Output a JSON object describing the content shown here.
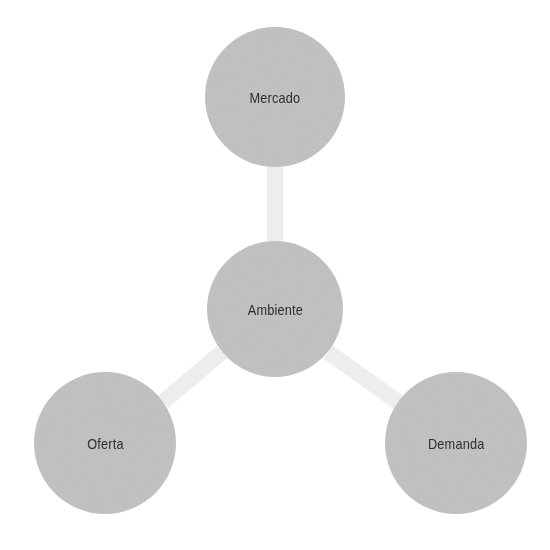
{
  "diagram": {
    "type": "hub-and-spoke",
    "colors": {
      "node_fill": "#c2c2c2",
      "connector": "#ececec",
      "text": "#2e2e2e",
      "background": "#ffffff"
    },
    "nodes": [
      {
        "id": "mercado",
        "label": "Mercado",
        "cx": 275,
        "cy": 97,
        "r": 70
      },
      {
        "id": "ambiente",
        "label": "Ambiente",
        "cx": 275,
        "cy": 309,
        "r": 68
      },
      {
        "id": "oferta",
        "label": "Oferta",
        "cx": 105,
        "cy": 443,
        "r": 71
      },
      {
        "id": "demanda",
        "label": "Demanda",
        "cx": 456,
        "cy": 443,
        "r": 71
      }
    ],
    "edges": [
      {
        "from": "ambiente",
        "to": "mercado"
      },
      {
        "from": "ambiente",
        "to": "oferta"
      },
      {
        "from": "ambiente",
        "to": "demanda"
      }
    ]
  }
}
